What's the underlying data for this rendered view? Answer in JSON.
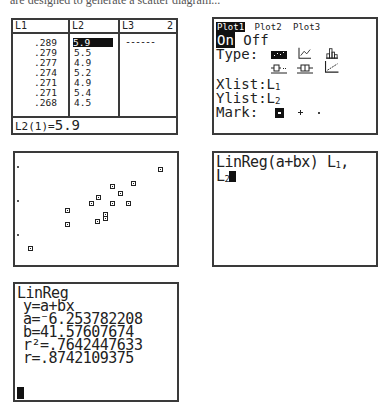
{
  "caption": "are designed to generate a scatter diagram...",
  "list_editor": {
    "headers": [
      "L1",
      "L2",
      "L3"
    ],
    "column_number": "2",
    "L1": [
      ".289",
      ".279",
      ".277",
      ".274",
      ".271",
      ".271",
      ".268"
    ],
    "L2": [
      "5.9",
      "5.5",
      "4.9",
      "5.2",
      "4.9",
      "5.4",
      "4.5"
    ],
    "L3_placeholder": "------",
    "selected_cell": "L2(1)",
    "footer_label": "L2(1)=",
    "footer_value": "5.9"
  },
  "stat_plot": {
    "tabs": [
      "Plot1",
      "Plot2",
      "Plot3"
    ],
    "active_tab": "Plot1",
    "on_label": "On",
    "off_label": "Off",
    "state": "On",
    "type_label": "Type:",
    "types": [
      "scatter-icon",
      "xyline-icon",
      "histogram-icon",
      "modboxplot-icon",
      "boxplot-icon",
      "normprob-icon"
    ],
    "selected_type": "scatter-icon",
    "xlist_label": "Xlist:",
    "xlist_value": "L",
    "xlist_sub": "1",
    "ylist_label": "Ylist:",
    "ylist_value": "L",
    "ylist_sub": "2",
    "mark_label": "Mark:",
    "marks": [
      "box-mark",
      "plus-mark",
      "dot-mark"
    ],
    "selected_mark": "box-mark"
  },
  "chart_data": {
    "type": "scatter",
    "title": "",
    "xlabel": "L1",
    "ylabel": "L2",
    "points_px": [
      [
        30,
        248
      ],
      [
        67,
        210
      ],
      [
        67,
        224
      ],
      [
        91,
        203
      ],
      [
        97,
        221
      ],
      [
        98,
        197
      ],
      [
        105,
        214
      ],
      [
        105,
        218
      ],
      [
        112,
        186
      ],
      [
        112,
        203
      ],
      [
        120,
        193
      ],
      [
        128,
        203
      ],
      [
        133,
        183
      ],
      [
        160,
        169
      ]
    ],
    "y_ticks_px": [
      166,
      200,
      234
    ],
    "grid": false,
    "legend": "none"
  },
  "command": {
    "text": "LinReg(a+bx) L",
    "sub1": "1",
    "sep": ",",
    "line2": "L",
    "sub2": "2"
  },
  "result": {
    "title": "LinReg",
    "eq": "y=a+bx",
    "a": "a=⁻6.253782208",
    "b": "b=41.57607674",
    "r2": "r²=.7642447633",
    "r": "r=.8742109375"
  }
}
